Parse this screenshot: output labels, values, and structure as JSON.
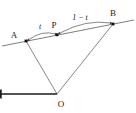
{
  "figure": {
    "kind": "geometry-diagram",
    "width": 136,
    "height": 113,
    "background_color": "#ffffff",
    "line_color": "#555555",
    "emphasis_color": "#1a1a1a",
    "label_color": "#1a1a1a"
  },
  "points": {
    "A": {
      "label": "A",
      "x": 26,
      "y": 41,
      "label_x": 15,
      "label_y": 36
    },
    "P": {
      "label": "P",
      "x": 57,
      "y": 35,
      "label_x": 53,
      "label_y": 26
    },
    "B": {
      "label": "B",
      "x": 113,
      "y": 24,
      "label_x": 111,
      "label_y": 15
    },
    "O": {
      "label": "O",
      "x": 57,
      "y": 94,
      "label_x": 60,
      "label_y": 107
    }
  },
  "segments": {
    "baseline": {
      "name": "line-through-A-P-B",
      "x1": 2,
      "y1": 46,
      "x2": 134,
      "y2": 20
    },
    "OA": {
      "name": "segment-O-A",
      "x1": 57,
      "y1": 94,
      "x2": 26,
      "y2": 41
    },
    "OB": {
      "name": "segment-O-B",
      "x1": 57,
      "y1": 94,
      "x2": 113,
      "y2": 24
    },
    "OP": {
      "name": "segment-O-P",
      "x1": 57,
      "y1": 94,
      "x2": 57,
      "y2": 34
    }
  },
  "annotations": {
    "t": {
      "text": "t",
      "label_x": 38,
      "label_y": 28,
      "arc_path": "M 28 39 Q 42 29 56 34",
      "from": "A",
      "to": "P"
    },
    "one_minus_t": {
      "text": "1 − t",
      "label_x": 75,
      "label_y": 19,
      "arc_path": "M 59 33 Q 86 18 111 23",
      "from": "P",
      "to": "B"
    }
  }
}
